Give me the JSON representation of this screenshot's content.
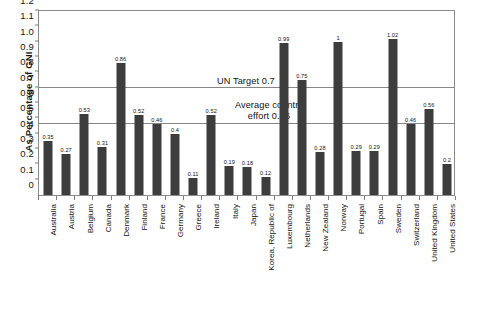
{
  "chart_data": {
    "type": "bar",
    "title": "",
    "xlabel": "",
    "ylabel": "As Percentage of GNI",
    "ylim": [
      0,
      1.2
    ],
    "ytick_step": 0.1,
    "grid": false,
    "legend": null,
    "bar_color": "#3d3d3d",
    "categories": [
      "Australia",
      "Austria",
      "Belgium",
      "Canada",
      "Denmark",
      "Finland",
      "France",
      "Germany",
      "Greece",
      "Ireland",
      "Italy",
      "Japan",
      "Korea, Republic of",
      "Luxembourg",
      "Netherlands",
      "New Zealand",
      "Norway",
      "Portugal",
      "Spain",
      "Sweden",
      "Switzerland",
      "United Kingdom",
      "United States"
    ],
    "values": [
      0.35,
      0.27,
      0.53,
      0.31,
      0.86,
      0.52,
      0.46,
      0.4,
      0.11,
      0.52,
      0.19,
      0.18,
      0.12,
      0.99,
      0.75,
      0.28,
      1,
      0.29,
      0.29,
      1.02,
      0.46,
      0.56,
      0.2
    ],
    "value_labels": [
      "0.35",
      "0.27",
      "0.53",
      "0.31",
      "0.86",
      "0.52",
      "0.46",
      "0.4",
      "0.11",
      "0.52",
      "0.19",
      "0.18",
      "0.12",
      "0.99",
      "0.75",
      "0.28",
      "1",
      "0.29",
      "0.29",
      "1.02",
      "0.46",
      "0.56",
      "0.2"
    ],
    "yticks": [
      "0",
      "0.1",
      "0.2",
      "0.3",
      "0.4",
      "0.5",
      "0.6",
      "0.7",
      "0.8",
      "0.9",
      "1.0",
      "1.1",
      "1.2"
    ],
    "annotations": [
      {
        "name": "un-target",
        "label": "UN Target 0.7",
        "value": 0.7,
        "type": "reference-line"
      },
      {
        "name": "average-country-effort",
        "label": "Average country effort 0.46",
        "value": 0.46,
        "type": "reference-line"
      }
    ]
  },
  "scan_artifact": {
    "text": ""
  }
}
